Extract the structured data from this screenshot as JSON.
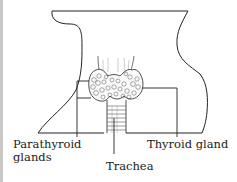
{
  "diagram": {
    "labels": {
      "parathyroid_line1": "Parathyroid",
      "parathyroid_line2": "glands",
      "thyroid": "Thyroid gland",
      "trachea": "Trachea"
    },
    "colors": {
      "stroke": "#222222",
      "background": "#ffffff",
      "frame": "#c8c8c8"
    }
  }
}
